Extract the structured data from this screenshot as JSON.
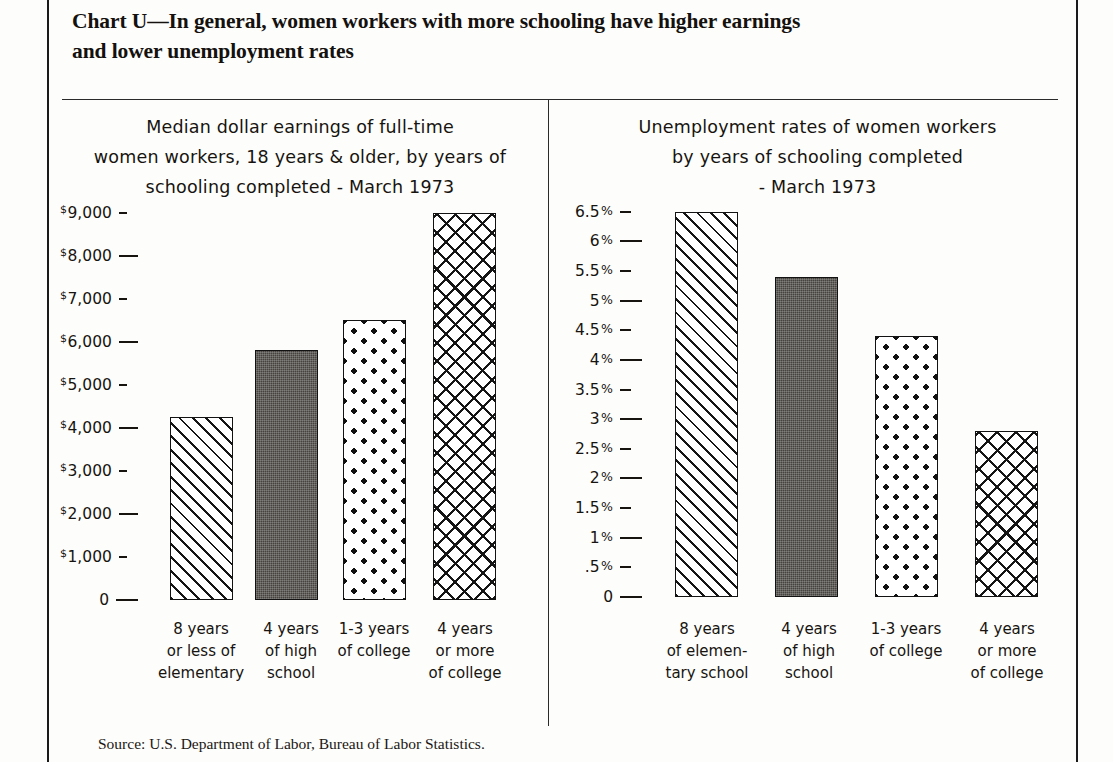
{
  "document": {
    "title_line1": "Chart U—In general, women workers with more schooling have higher earnings",
    "title_line2": "and lower unemployment rates",
    "source": "Source: U.S. Department of Labor, Bureau of Labor Statistics."
  },
  "chart_data": [
    {
      "type": "bar",
      "panel": "left",
      "title": "Median dollar earnings of full-time women workers, 18 years & older, by years of schooling completed - March 1973",
      "subtitle_lines": [
        "Median dollar earnings of  full-time",
        "women workers, 18 years & older, by years of",
        "schooling completed - March 1973"
      ],
      "xlabel": "",
      "ylabel": "",
      "ylim": [
        0,
        9500
      ],
      "grid": false,
      "legend": "none",
      "categories": [
        "8 years or less of elementary",
        "4 years of high school",
        "1-3 years of college",
        "4 years or more of college"
      ],
      "category_lines": [
        [
          "8 years",
          "or less of",
          "elementary"
        ],
        [
          "4 years",
          "of high",
          "school"
        ],
        [
          "1-3 years",
          "of college"
        ],
        [
          "4 years",
          "or more",
          "of college"
        ]
      ],
      "values": [
        4250,
        5800,
        6500,
        9000
      ],
      "value_unit": "US dollars",
      "bar_patterns": [
        "diagonal-hatch",
        "solid-dark",
        "polka-dots",
        "cross-hatch"
      ],
      "ticks": [
        {
          "label": "$9,000",
          "value": 9000,
          "dash": "short"
        },
        {
          "label": "$8,000",
          "value": 8000,
          "dash": "long"
        },
        {
          "label": "$7,000",
          "value": 7000,
          "dash": "short"
        },
        {
          "label": "$6,000",
          "value": 6000,
          "dash": "long"
        },
        {
          "label": "$5,000",
          "value": 5000,
          "dash": "short"
        },
        {
          "label": "$4,000",
          "value": 4000,
          "dash": "long"
        },
        {
          "label": "$3,000",
          "value": 3000,
          "dash": "short"
        },
        {
          "label": "$2,000",
          "value": 2000,
          "dash": "long"
        },
        {
          "label": "$1,000",
          "value": 1000,
          "dash": "short"
        },
        {
          "label": "0",
          "value": 0,
          "dash": "long"
        }
      ]
    },
    {
      "type": "bar",
      "panel": "right",
      "title": "Unemployment rates of women workers by years of schooling completed - March 1973",
      "subtitle_lines": [
        "Unemployment rates of women workers",
        "by years of schooling completed",
        "- March 1973"
      ],
      "xlabel": "",
      "ylabel": "",
      "ylim": [
        0,
        6.75
      ],
      "grid": false,
      "legend": "none",
      "categories": [
        "8 years of elementary school",
        "4 years of high school",
        "1-3 years of college",
        "4 years or more of college"
      ],
      "category_lines": [
        [
          "8 years",
          "of elemen-",
          "tary school"
        ],
        [
          "4 years",
          "of high",
          "school"
        ],
        [
          "1-3 years",
          "of college"
        ],
        [
          "4 years",
          "or more",
          "of college"
        ]
      ],
      "values": [
        6.5,
        5.4,
        4.4,
        2.8
      ],
      "value_unit": "percent",
      "bar_patterns": [
        "diagonal-hatch",
        "solid-dark",
        "polka-dots",
        "cross-hatch"
      ],
      "ticks": [
        {
          "label": "6.5%",
          "value": 6.5,
          "dash": "short"
        },
        {
          "label": "6%",
          "value": 6.0,
          "dash": "long"
        },
        {
          "label": "5.5%",
          "value": 5.5,
          "dash": "short"
        },
        {
          "label": "5%",
          "value": 5.0,
          "dash": "long"
        },
        {
          "label": "4.5%",
          "value": 4.5,
          "dash": "short"
        },
        {
          "label": "4%",
          "value": 4.0,
          "dash": "long"
        },
        {
          "label": "3.5%",
          "value": 3.5,
          "dash": "short"
        },
        {
          "label": "3%",
          "value": 3.0,
          "dash": "long"
        },
        {
          "label": "2.5%",
          "value": 2.5,
          "dash": "short"
        },
        {
          "label": "2%",
          "value": 2.0,
          "dash": "long"
        },
        {
          "label": "1.5%",
          "value": 1.5,
          "dash": "short"
        },
        {
          "label": "1%",
          "value": 1.0,
          "dash": "long"
        },
        {
          "label": ".5%",
          "value": 0.5,
          "dash": "short"
        },
        {
          "label": "0",
          "value": 0,
          "dash": "long"
        }
      ]
    }
  ]
}
